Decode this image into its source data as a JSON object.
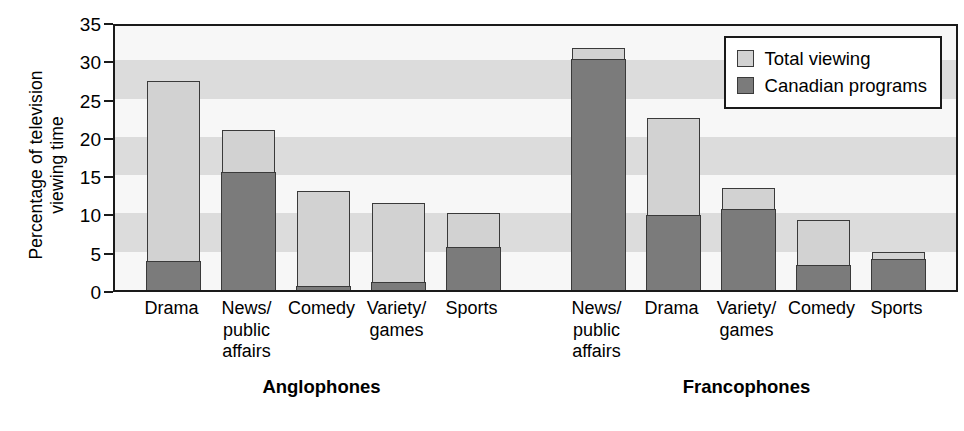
{
  "chart_data": {
    "type": "bar",
    "subtype": "overlaid-stacked",
    "title": "",
    "xlabel": "",
    "ylabel": "Percentage of television viewing time",
    "ylabel_lines": [
      "Percentage of television",
      "viewing time"
    ],
    "ylim": [
      0,
      35
    ],
    "yticks": [
      0,
      5,
      10,
      15,
      20,
      25,
      30,
      35
    ],
    "ytick_labels": [
      "0",
      "5",
      "10",
      "15",
      "20",
      "25",
      "30",
      "35"
    ],
    "grid": "alternating horizontal bands every 5 units",
    "legend": {
      "position": "top-right inside plot",
      "entries": [
        {
          "name": "Total viewing",
          "color": "#d2d2d2"
        },
        {
          "name": "Canadian programs",
          "color": "#7b7b7b"
        }
      ]
    },
    "groups": [
      {
        "name": "Anglophones",
        "categories": [
          "Drama",
          "News/ public affairs",
          "Comedy",
          "Variety/ games",
          "Sports"
        ],
        "category_lines": [
          [
            "Drama"
          ],
          [
            "News/",
            "public",
            "affairs"
          ],
          [
            "Comedy"
          ],
          [
            "Variety/",
            "games"
          ],
          [
            "Sports"
          ]
        ],
        "series": [
          {
            "name": "Total viewing",
            "values": [
              27.3,
              20.9,
              12.9,
              11.4,
              10.0
            ]
          },
          {
            "name": "Canadian programs",
            "values": [
              3.9,
              15.5,
              0.6,
              1.1,
              5.7
            ]
          }
        ]
      },
      {
        "name": "Francophones",
        "categories": [
          "News/ public affairs",
          "Drama",
          "Variety/ games",
          "Comedy",
          "Sports"
        ],
        "category_lines": [
          [
            "News/",
            "public",
            "affairs"
          ],
          [
            "Drama"
          ],
          [
            "Variety/",
            "games"
          ],
          [
            "Comedy"
          ],
          [
            "Sports"
          ]
        ],
        "series": [
          {
            "name": "Total viewing",
            "values": [
              31.6,
              22.4,
              13.3,
              9.2,
              5.0
            ]
          },
          {
            "name": "Canadian programs",
            "values": [
              30.3,
              9.9,
              10.7,
              3.3,
              4.1
            ]
          }
        ]
      }
    ]
  },
  "colors": {
    "total_viewing": "#d2d2d2",
    "canadian_programs": "#7b7b7b",
    "band_shade": "#dcdcdc",
    "band_plain": "#f7f7f7",
    "outline": "#1a1a1a"
  }
}
